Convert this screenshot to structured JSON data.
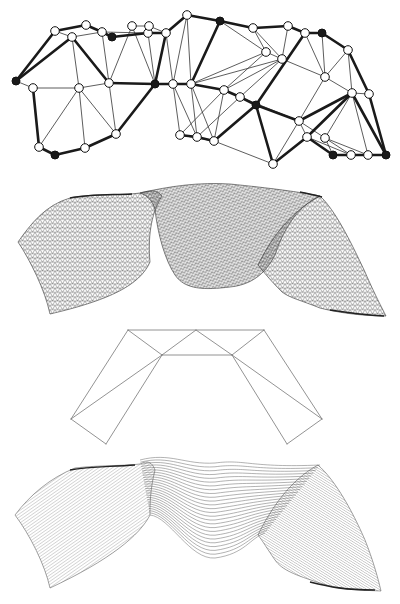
{
  "figure": {
    "width": 400,
    "height": 604,
    "background": "#ffffff",
    "ink": "#1a1a1a",
    "panels": [
      "triangulated-graph",
      "triangle-mesh-surface",
      "folded-strip-outline",
      "line-mesh-surface"
    ]
  },
  "graph": {
    "nodes": [
      [
        16,
        81,
        1
      ],
      [
        33,
        88,
        0
      ],
      [
        39,
        147,
        0
      ],
      [
        55,
        155,
        1
      ],
      [
        85,
        148,
        0
      ],
      [
        116,
        134,
        0
      ],
      [
        55,
        31,
        0
      ],
      [
        72,
        37,
        0
      ],
      [
        86,
        25,
        0
      ],
      [
        102,
        32,
        0
      ],
      [
        112,
        37,
        1
      ],
      [
        79,
        88,
        0
      ],
      [
        109,
        83,
        0
      ],
      [
        132,
        26,
        0
      ],
      [
        148,
        33,
        0
      ],
      [
        149,
        26,
        0
      ],
      [
        166,
        33,
        0
      ],
      [
        187,
        15,
        0
      ],
      [
        155,
        84,
        1
      ],
      [
        173,
        84,
        0
      ],
      [
        191,
        84,
        0
      ],
      [
        180,
        135,
        0
      ],
      [
        197,
        137,
        0
      ],
      [
        214,
        141,
        0
      ],
      [
        220,
        21,
        1
      ],
      [
        253,
        28,
        0
      ],
      [
        288,
        26,
        0
      ],
      [
        266,
        52,
        0
      ],
      [
        282,
        59,
        0
      ],
      [
        305,
        33,
        0
      ],
      [
        322,
        33,
        1
      ],
      [
        348,
        50,
        0
      ],
      [
        325,
        77,
        0
      ],
      [
        224,
        90,
        0
      ],
      [
        240,
        97,
        0
      ],
      [
        256,
        105,
        1
      ],
      [
        299,
        121,
        0
      ],
      [
        352,
        93,
        0
      ],
      [
        369,
        94,
        0
      ],
      [
        307,
        137,
        0
      ],
      [
        325,
        138,
        0
      ],
      [
        333,
        155,
        1
      ],
      [
        351,
        155,
        0
      ],
      [
        368,
        155,
        0
      ],
      [
        386,
        155,
        1
      ],
      [
        273,
        164,
        0
      ]
    ],
    "thick_edges": [
      [
        0,
        6
      ],
      [
        6,
        8
      ],
      [
        8,
        9
      ],
      [
        9,
        10
      ],
      [
        10,
        14
      ],
      [
        14,
        16
      ],
      [
        16,
        17
      ],
      [
        17,
        24
      ],
      [
        24,
        25
      ],
      [
        25,
        26
      ],
      [
        26,
        29
      ],
      [
        29,
        30
      ],
      [
        30,
        31
      ],
      [
        31,
        38
      ],
      [
        38,
        44
      ],
      [
        0,
        7
      ],
      [
        7,
        12
      ],
      [
        12,
        18
      ],
      [
        18,
        19
      ],
      [
        19,
        20
      ],
      [
        18,
        5
      ],
      [
        5,
        4
      ],
      [
        4,
        3
      ],
      [
        3,
        2
      ],
      [
        2,
        1
      ],
      [
        16,
        18
      ],
      [
        24,
        20
      ],
      [
        20,
        33
      ],
      [
        33,
        34
      ],
      [
        34,
        35
      ],
      [
        35,
        23
      ],
      [
        23,
        22
      ],
      [
        22,
        21
      ],
      [
        29,
        35
      ],
      [
        35,
        36
      ],
      [
        36,
        37
      ],
      [
        37,
        44
      ],
      [
        35,
        45
      ],
      [
        45,
        39
      ],
      [
        39,
        41
      ],
      [
        41,
        42
      ],
      [
        42,
        43
      ],
      [
        43,
        44
      ],
      [
        37,
        39
      ]
    ],
    "thin_edges": [
      [
        0,
        1
      ],
      [
        1,
        11
      ],
      [
        11,
        12
      ],
      [
        6,
        7
      ],
      [
        7,
        11
      ],
      [
        11,
        2
      ],
      [
        11,
        4
      ],
      [
        11,
        5
      ],
      [
        12,
        5
      ],
      [
        7,
        9
      ],
      [
        9,
        12
      ],
      [
        8,
        10
      ],
      [
        9,
        14
      ],
      [
        12,
        13
      ],
      [
        13,
        18
      ],
      [
        14,
        18
      ],
      [
        15,
        16
      ],
      [
        13,
        15
      ],
      [
        14,
        16
      ],
      [
        16,
        19
      ],
      [
        17,
        19
      ],
      [
        17,
        20
      ],
      [
        19,
        21
      ],
      [
        19,
        22
      ],
      [
        20,
        22
      ],
      [
        20,
        23
      ],
      [
        21,
        33
      ],
      [
        22,
        34
      ],
      [
        24,
        27
      ],
      [
        25,
        27
      ],
      [
        27,
        28
      ],
      [
        25,
        28
      ],
      [
        28,
        33
      ],
      [
        27,
        33
      ],
      [
        28,
        34
      ],
      [
        26,
        28
      ],
      [
        28,
        32
      ],
      [
        29,
        32
      ],
      [
        32,
        37
      ],
      [
        32,
        36
      ],
      [
        32,
        31
      ],
      [
        37,
        38
      ],
      [
        36,
        40
      ],
      [
        36,
        39
      ],
      [
        37,
        40
      ],
      [
        40,
        41
      ],
      [
        40,
        42
      ],
      [
        39,
        42
      ],
      [
        40,
        43
      ],
      [
        37,
        43
      ],
      [
        45,
        36
      ],
      [
        45,
        23
      ],
      [
        34,
        36
      ],
      [
        28,
        20
      ],
      [
        27,
        20
      ],
      [
        33,
        23
      ],
      [
        21,
        23
      ],
      [
        30,
        32
      ],
      [
        31,
        37
      ]
    ]
  },
  "fold_outline": {
    "points": {
      "top_left": [
        128,
        330
      ],
      "top_mid": [
        196,
        330
      ],
      "top_right": [
        264,
        330
      ],
      "inner_left": [
        162,
        355
      ],
      "inner_right": [
        232,
        355
      ],
      "outer_left": [
        71,
        419
      ],
      "outer_right": [
        322,
        419
      ],
      "bottom_left": [
        106,
        444
      ],
      "bottom_right": [
        287,
        444
      ]
    },
    "segments": [
      [
        "top_left",
        "top_right"
      ],
      [
        "top_left",
        "outer_left"
      ],
      [
        "top_left",
        "inner_left"
      ],
      [
        "inner_left",
        "top_mid"
      ],
      [
        "top_mid",
        "inner_right"
      ],
      [
        "inner_left",
        "inner_right"
      ],
      [
        "top_right",
        "inner_right"
      ],
      [
        "top_right",
        "outer_right"
      ],
      [
        "inner_left",
        "outer_left"
      ],
      [
        "outer_left",
        "bottom_left"
      ],
      [
        "bottom_left",
        "inner_left"
      ],
      [
        "inner_right",
        "outer_right"
      ],
      [
        "outer_right",
        "bottom_right"
      ],
      [
        "bottom_right",
        "inner_right"
      ]
    ]
  },
  "surfaces": {
    "mesh_top_offset": 175,
    "lines_top_offset": 450
  }
}
